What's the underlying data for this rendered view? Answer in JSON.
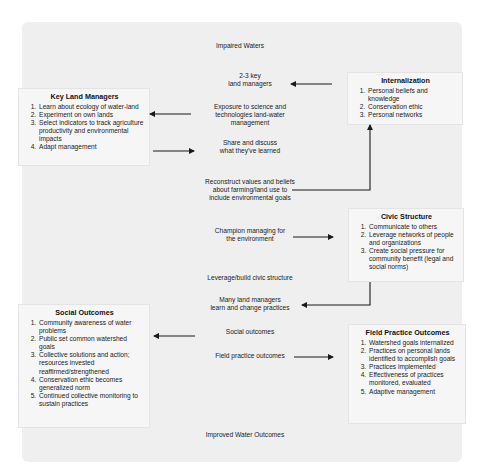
{
  "diagram": {
    "top_label": "Impaired Waters",
    "bottom_label": "Improved Water Outcomes",
    "center_steps": [
      {
        "id": "key_managers",
        "text": "2-3 key\nland managers"
      },
      {
        "id": "exposure",
        "text": "Exposure to science and\ntechnologies land-water\nmanagement"
      },
      {
        "id": "share",
        "text": "Share and discuss\nwhat they've learned"
      },
      {
        "id": "reconstruct",
        "text": "Reconstruct values and beliefs\nabout farming/land use to\ninclude environmental goals"
      },
      {
        "id": "champion",
        "text": "Champion managing for\nthe environment"
      },
      {
        "id": "leverage",
        "text": "Leverage/build civic structure"
      },
      {
        "id": "many",
        "text": "Many land managers\nlearn and change practices"
      },
      {
        "id": "social",
        "text": "Social outcomes"
      },
      {
        "id": "field",
        "text": "Field practice outcomes"
      }
    ],
    "boxes": {
      "internalization": {
        "title": "Internalization",
        "items": [
          "Personal beliefs and knowledge",
          "Conservation ethic",
          "Personal networks"
        ]
      },
      "key_land_managers": {
        "title": "Key Land Managers",
        "items": [
          "Learn about ecology of water-land",
          "Experiment on own lands",
          "Select indicators to track agriculture productivity and environmental impacts",
          "Adapt management"
        ]
      },
      "civic_structure": {
        "title": "Civic Structure",
        "items": [
          "Communicate to others",
          "Leverage networks of people and organizations",
          "Create social pressure for community benefit (legal and social norms)"
        ]
      },
      "social_outcomes": {
        "title": "Social Outcomes",
        "items": [
          "Community awareness of water problems",
          "Public set common watershed goals",
          "Collective solutions and action; resources invested reaffirmed/strengthened",
          "Conservation ethic becomes generalized norm",
          "Continued collective monitoring to sustain practices"
        ]
      },
      "field_practice_outcomes": {
        "title": "Field Practice Outcomes",
        "items": [
          "Watershed goals internalized",
          "Practices on personal lands identified to accomplish goals",
          "Practices implemented",
          "Effectiveness of practices monitored, evaluated",
          "Adaptive management"
        ]
      }
    },
    "arrows": [
      {
        "from": "internalization",
        "to": "key_managers",
        "direction": "left"
      },
      {
        "from": "exposure",
        "to": "key_land_managers",
        "direction": "left"
      },
      {
        "from": "key_land_managers",
        "to": "share",
        "direction": "right"
      },
      {
        "from": "reconstruct",
        "to": "internalization",
        "direction": "right-then-up"
      },
      {
        "from": "champion",
        "to": "civic_structure",
        "direction": "right"
      },
      {
        "from": "civic_structure",
        "to": "many",
        "direction": "down-then-left"
      },
      {
        "from": "social",
        "to": "social_outcomes",
        "direction": "left"
      },
      {
        "from": "field",
        "to": "field_practice_outcomes",
        "direction": "right"
      }
    ],
    "colors": {
      "panel_bg": "#efefef",
      "box_bg": "#f6f6f6",
      "arrow": "#1a1a1a",
      "text": "#222222"
    }
  }
}
